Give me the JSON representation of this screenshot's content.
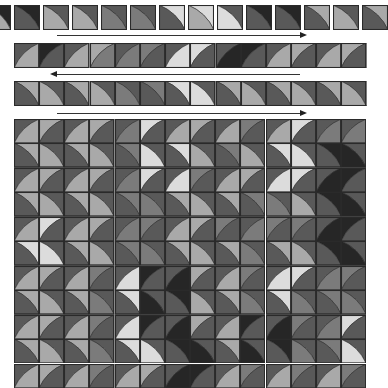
{
  "palette": {
    "k": "#262626",
    "d": "#595959",
    "m": "#7b7b7b",
    "l": "#a9a9a9",
    "w": "#dcdcdc",
    "line": "#2a2a2a"
  },
  "strips": [
    {
      "name": "unit-row-1",
      "x": -15,
      "y": 5,
      "cell": 26,
      "gap": 3,
      "count": 14,
      "cells": [
        [
          "\\",
          "k",
          "l"
        ],
        [
          "\\",
          "k",
          "d"
        ],
        [
          "\\",
          "d",
          "l"
        ],
        [
          "\\",
          "d",
          "l"
        ],
        [
          "\\",
          "d",
          "m"
        ],
        [
          "\\",
          "d",
          "m"
        ],
        [
          "\\",
          "w",
          "d"
        ],
        [
          "\\",
          "w",
          "l"
        ],
        [
          "\\",
          "d",
          "w"
        ],
        [
          "\\",
          "k",
          "d"
        ],
        [
          "\\",
          "k",
          "d"
        ],
        [
          "\\",
          "l",
          "d"
        ],
        [
          "\\",
          "d",
          "l"
        ],
        [
          "\\",
          "l",
          "d"
        ]
      ]
    },
    {
      "name": "unit-row-2",
      "x": 14,
      "y": 43,
      "cell": 25.2,
      "gap": 0,
      "count": 14,
      "cells": [
        [
          "/",
          "d",
          "l"
        ],
        [
          "/",
          "k",
          "d"
        ],
        [
          "/",
          "d",
          "l"
        ],
        [
          "/",
          "l",
          "m"
        ],
        [
          "/",
          "d",
          "m"
        ],
        [
          "/",
          "m",
          "d"
        ],
        [
          "/",
          "d",
          "w"
        ],
        [
          "/",
          "w",
          "d"
        ],
        [
          "/",
          "d",
          "k"
        ],
        [
          "/",
          "k",
          "d"
        ],
        [
          "/",
          "d",
          "l"
        ],
        [
          "/",
          "l",
          "d"
        ],
        [
          "/",
          "d",
          "l"
        ],
        [
          "/",
          "l",
          "d"
        ]
      ]
    },
    {
      "name": "unit-row-3",
      "x": 14,
      "y": 81,
      "cell": 25.2,
      "gap": 0,
      "count": 14,
      "cells": [
        [
          "\\",
          "l",
          "d"
        ],
        [
          "\\",
          "d",
          "l"
        ],
        [
          "\\",
          "l",
          "d"
        ],
        [
          "\\",
          "d",
          "l"
        ],
        [
          "\\",
          "d",
          "m"
        ],
        [
          "\\",
          "m",
          "d"
        ],
        [
          "\\",
          "w",
          "d"
        ],
        [
          "\\",
          "d",
          "w"
        ],
        [
          "\\",
          "l",
          "d"
        ],
        [
          "\\",
          "d",
          "l"
        ],
        [
          "\\",
          "l",
          "d"
        ],
        [
          "\\",
          "d",
          "l"
        ],
        [
          "\\",
          "l",
          "d"
        ],
        [
          "\\",
          "d",
          "l"
        ]
      ]
    }
  ],
  "arrows": [
    {
      "name": "arrow-row-1",
      "direction": "right",
      "x1": 57,
      "x2": 301,
      "y": 35
    },
    {
      "name": "arrow-row-2",
      "direction": "left",
      "x1": 56,
      "x2": 300,
      "y": 74
    },
    {
      "name": "arrow-row-3",
      "direction": "right",
      "x1": 57,
      "x2": 301,
      "y": 113
    }
  ],
  "grid": {
    "x": 14,
    "y": 119,
    "cols": 14,
    "rows": 11,
    "cellW": 25.15,
    "cellH": 24.45,
    "band_shades": [
      [
        "l",
        "l",
        "l",
        "l",
        "m",
        "w",
        "l",
        "l",
        "l",
        "m",
        "l",
        "w",
        "m",
        "d"
      ],
      [
        "l",
        "l",
        "l",
        "l",
        "m",
        "w",
        "w",
        "l",
        "m",
        "l",
        "w",
        "w",
        "k",
        "k"
      ],
      [
        "l",
        "l",
        "l",
        "l",
        "m",
        "w",
        "w",
        "m",
        "l",
        "l",
        "w",
        "w",
        "k",
        "k"
      ],
      [
        "l",
        "l",
        "l",
        "l",
        "m",
        "m",
        "l",
        "l",
        "l",
        "d",
        "d",
        "l",
        "k",
        "k"
      ],
      [
        "l",
        "w",
        "l",
        "l",
        "m",
        "m",
        "l",
        "l",
        "d",
        "d",
        "d",
        "m",
        "k",
        "k"
      ],
      [
        "w",
        "w",
        "l",
        "l",
        "m",
        "m",
        "l",
        "l",
        "l",
        "m",
        "l",
        "l",
        "k",
        "k"
      ],
      [
        "l",
        "l",
        "l",
        "m",
        "w",
        "k",
        "k",
        "l",
        "l",
        "m",
        "w",
        "w",
        "m",
        "m"
      ],
      [
        "l",
        "l",
        "l",
        "m",
        "w",
        "k",
        "k",
        "l",
        "l",
        "m",
        "w",
        "m",
        "m",
        "m"
      ],
      [
        "l",
        "l",
        "l",
        "m",
        "w",
        "k",
        "k",
        "l",
        "l",
        "k",
        "k",
        "m",
        "m",
        "w"
      ],
      [
        "l",
        "l",
        "l",
        "m",
        "w",
        "w",
        "k",
        "k",
        "l",
        "k",
        "k",
        "m",
        "m",
        "w"
      ],
      [
        "l",
        "l",
        "l",
        "m",
        "l",
        "l",
        "k",
        "k",
        "l",
        "m",
        "l",
        "m",
        "l",
        "m"
      ]
    ],
    "bg_shade": "d"
  }
}
